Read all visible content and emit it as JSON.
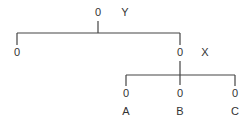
{
  "tree": {
    "root": {
      "value": "0",
      "label": "Y",
      "x": 98,
      "y": 16
    },
    "left_leaf": {
      "value": "0",
      "label": "",
      "x": 17,
      "y": 56
    },
    "right_node": {
      "value": "0",
      "label": "X",
      "x": 180,
      "y": 56
    },
    "children": [
      {
        "value": "0",
        "label": "A",
        "x": 126
      },
      {
        "value": "0",
        "label": "B",
        "x": 180
      },
      {
        "value": "0",
        "label": "C",
        "x": 235
      }
    ]
  }
}
